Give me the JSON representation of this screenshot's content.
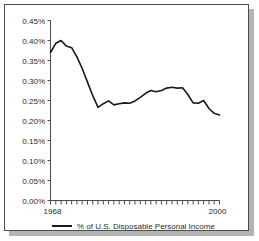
{
  "chart_data": {
    "type": "line",
    "title": "",
    "xlabel": "",
    "ylabel": "",
    "xlim": [
      1968,
      2000
    ],
    "ylim": [
      0.0,
      0.45
    ],
    "grid": false,
    "legend_position": "bottom",
    "y_tick_labels": [
      "0.45%",
      "0.40%",
      "0.35%",
      "0.30%",
      "0.25%",
      "0.20%",
      "0.15%",
      "0.10%",
      "0.05%",
      "0.00%"
    ],
    "y_tick_values": [
      0.45,
      0.4,
      0.35,
      0.3,
      0.25,
      0.2,
      0.15,
      0.1,
      0.05,
      0.0
    ],
    "x_tick_labels": [
      "1968",
      "2000"
    ],
    "x_tick_values": [
      1968,
      2000
    ],
    "x_minor_tick_count": 33,
    "series": [
      {
        "name": "% of U.S. Disposable Personal Income",
        "color": "#1a1a1a",
        "x": [
          1968,
          1969,
          1970,
          1971,
          1972,
          1973,
          1974,
          1975,
          1976,
          1977,
          1978,
          1979,
          1980,
          1981,
          1982,
          1983,
          1984,
          1985,
          1986,
          1987,
          1988,
          1989,
          1990,
          1991,
          1992,
          1993,
          1994,
          1995,
          1996,
          1997,
          1998,
          1999,
          2000
        ],
        "values": [
          0.37,
          0.393,
          0.4,
          0.386,
          0.382,
          0.359,
          0.33,
          0.296,
          0.262,
          0.233,
          0.242,
          0.249,
          0.239,
          0.242,
          0.244,
          0.243,
          0.249,
          0.258,
          0.268,
          0.275,
          0.272,
          0.275,
          0.281,
          0.283,
          0.281,
          0.282,
          0.265,
          0.244,
          0.243,
          0.25,
          0.23,
          0.218,
          0.214
        ]
      }
    ]
  },
  "legend": {
    "items": [
      {
        "label": "% of U.S. Disposable Personal Income",
        "color": "#1a1a1a"
      }
    ]
  },
  "axes": {
    "y_labels": [
      "0.45%",
      "0.40%",
      "0.35%",
      "0.30%",
      "0.25%",
      "0.20%",
      "0.15%",
      "0.10%",
      "0.05%",
      "0.00%"
    ],
    "x_start_label": "1968",
    "x_end_label": "2000"
  },
  "colors": {
    "line": "#1a1a1a",
    "axis": "#4c4c4c",
    "text": "#2b2b2b",
    "frame": "#4c4c4c",
    "shadow": "#b4b4b4",
    "background": "#ffffff"
  }
}
